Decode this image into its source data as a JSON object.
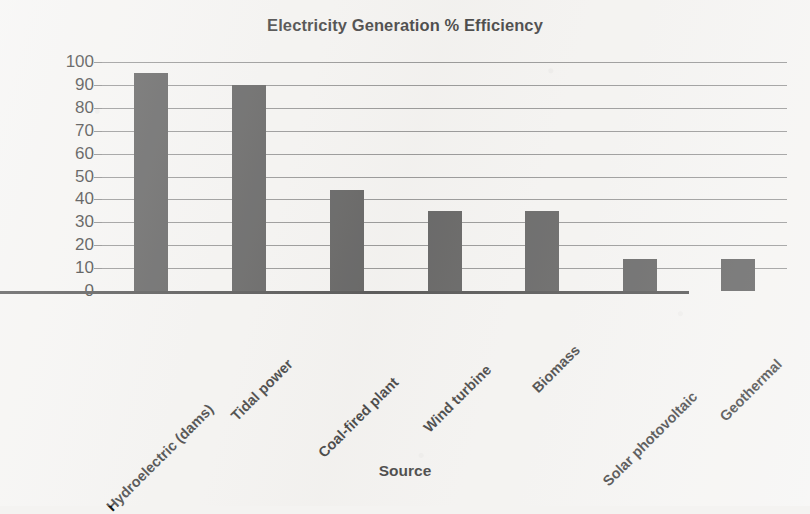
{
  "chart_data": {
    "type": "bar",
    "title": "Electricity Generation % Efficiency",
    "xlabel": "Source",
    "ylabel": "Percent",
    "categories": [
      "Hydroelectric (dams)",
      "Tidal power",
      "Coal-fired plant",
      "Wind turbine",
      "Biomass",
      "Solar photovoltaic",
      "Geothermal"
    ],
    "values": [
      95,
      90,
      44,
      35,
      35,
      14,
      14
    ],
    "ylim": [
      0,
      100
    ],
    "ytick_labels": [
      "100",
      "90",
      "80",
      "70",
      "60",
      "50",
      "40",
      "30",
      "20",
      "10",
      "0"
    ],
    "ytick_values": [
      100,
      90,
      80,
      70,
      60,
      50,
      40,
      30,
      20,
      10,
      0
    ],
    "grid": true,
    "legend": "none",
    "bar_color": "#3b3b3b",
    "grid_color": "#7d7d7d",
    "axis_color": "#2a2a2a",
    "background_color": "#f4f3f1"
  }
}
